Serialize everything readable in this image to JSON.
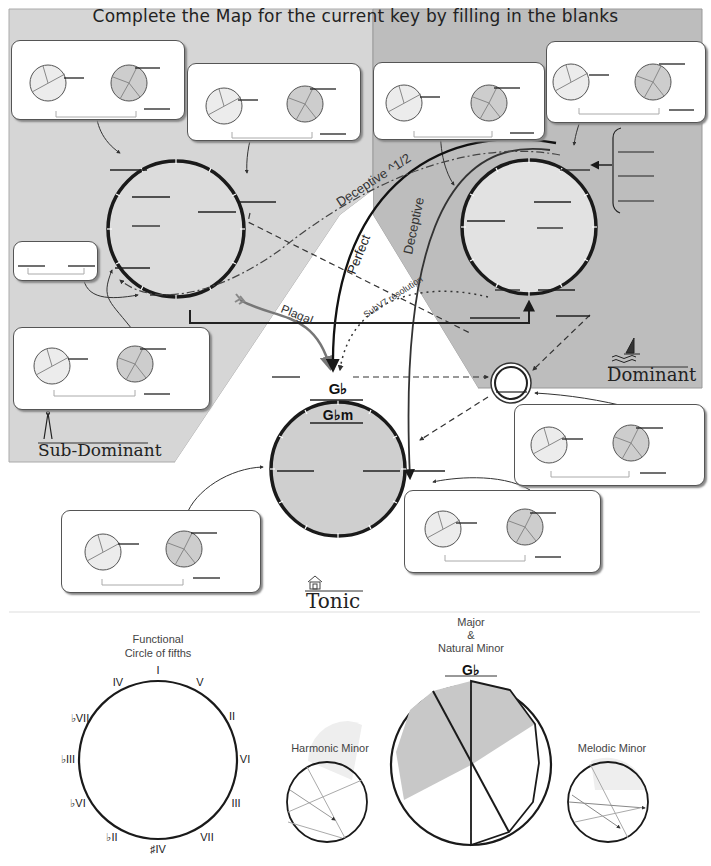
{
  "title": "Complete the Map for the current  key by filling in the blanks",
  "regions": {
    "sub_dominant": {
      "label": "Sub-Dominant",
      "icon": "compass-icon"
    },
    "dominant": {
      "label": "Dominant",
      "icon": "sailboat-icon"
    },
    "tonic": {
      "label": "Tonic",
      "icon": "house-icon"
    }
  },
  "tonic_circle": {
    "key_major": "G♭",
    "key_minor": "G♭m"
  },
  "cadence_labels": {
    "deceptive_half": "Deceptive ^1/2",
    "deceptive": "Deceptive",
    "perfect": "Perfect",
    "plagal": "Plagal",
    "subv7": "SubV7 resolution"
  },
  "colors": {
    "subdominant_bg": "#d6d6d6",
    "dominant_bg": "#bdbdbd",
    "tonic_fill": "#cfcfcf",
    "line": "#1a1a1a",
    "card_bg": "#ffffff"
  },
  "bottom": {
    "functional": {
      "title_line1": "Functional",
      "title_line2": "Circle of fifths",
      "degrees": [
        "I",
        "V",
        "II",
        "VI",
        "III",
        "VII",
        "♯IV",
        "♭II",
        "♭VI",
        "♭III",
        "♭VII",
        "IV"
      ]
    },
    "harmonic_minor": {
      "title": "Harmonic Minor"
    },
    "major_natural": {
      "title_line1": "Major",
      "title_line2": "&",
      "title_line3": "Natural Minor",
      "key": "G♭"
    },
    "melodic_minor": {
      "title": "Melodic Minor"
    }
  }
}
